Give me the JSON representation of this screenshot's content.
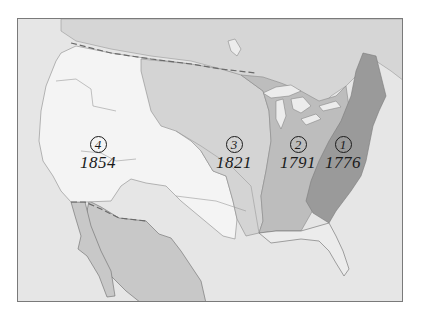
{
  "map": {
    "title": "",
    "type": "historical-territorial-expansion",
    "colors": {
      "water": "#e6e6e6",
      "foreign_land_north": "#d6d6d6",
      "foreign_land_south": "#c8c8c8",
      "region_1": "#9a9a9a",
      "region_2": "#bdbdbd",
      "region_3": "#d4d4d4",
      "region_4": "#f4f4f4",
      "lakes": "#ececec",
      "border_line": "#6a6a6a"
    },
    "regions": [
      {
        "id": "1",
        "number": "1",
        "year": "1776",
        "shade": "darkest"
      },
      {
        "id": "2",
        "number": "2",
        "year": "1791",
        "shade": "dark"
      },
      {
        "id": "3",
        "number": "3",
        "year": "1821",
        "shade": "medium"
      },
      {
        "id": "4",
        "number": "4",
        "year": "1854",
        "shade": "lightest"
      }
    ]
  }
}
